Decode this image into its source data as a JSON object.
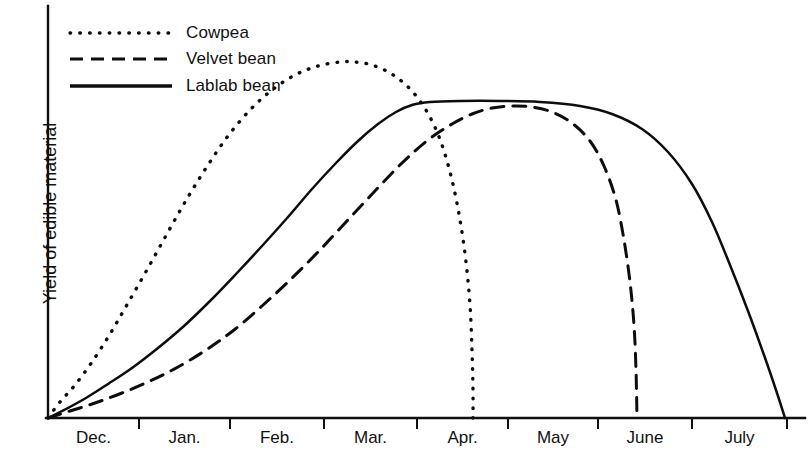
{
  "chart_data": {
    "type": "line",
    "title": "",
    "subtitle": "",
    "xlabel": "",
    "ylabel": "Yield of edible material",
    "grid": false,
    "legend_position": "top-left",
    "x_tick_labels": [
      "Dec.",
      "Jan.",
      "Feb.",
      "Mar.",
      "Apr.",
      "May",
      "June",
      "July"
    ],
    "x_tick_positions_px": [
      139,
      230,
      324,
      417,
      508,
      598,
      692,
      787
    ],
    "x_axis_range_px": [
      48,
      805
    ],
    "y_axis_range_px": [
      418,
      6
    ],
    "y_axis_ticks": [],
    "y_axis_note": "Unlabeled relative scale; baseline at zero yield",
    "series": [
      {
        "name": "Cowpea",
        "style": "dotted",
        "color": "#0d0d0d",
        "points_px": [
          [
            48,
            418
          ],
          [
            60,
            402
          ],
          [
            75,
            385
          ],
          [
            92,
            362
          ],
          [
            110,
            334
          ],
          [
            128,
            303
          ],
          [
            148,
            268
          ],
          [
            168,
            232
          ],
          [
            188,
            197
          ],
          [
            208,
            165
          ],
          [
            228,
            136
          ],
          [
            250,
            110
          ],
          [
            272,
            90
          ],
          [
            295,
            75
          ],
          [
            318,
            66
          ],
          [
            340,
            62
          ],
          [
            355,
            62
          ],
          [
            372,
            65
          ],
          [
            390,
            73
          ],
          [
            406,
            85
          ],
          [
            420,
            101
          ],
          [
            432,
            121
          ],
          [
            442,
            145
          ],
          [
            452,
            180
          ],
          [
            460,
            220
          ],
          [
            466,
            262
          ],
          [
            470,
            305
          ],
          [
            472,
            350
          ],
          [
            473,
            390
          ],
          [
            473,
            418
          ]
        ],
        "peak_month": "Mar.",
        "peak_px": [
          350,
          62
        ],
        "end_month": "Apr.",
        "end_px": [
          473,
          418
        ]
      },
      {
        "name": "Velvet bean",
        "style": "dashed",
        "color": "#0d0d0d",
        "points_px": [
          [
            48,
            418
          ],
          [
            70,
            411
          ],
          [
            95,
            403
          ],
          [
            122,
            393
          ],
          [
            150,
            381
          ],
          [
            178,
            367
          ],
          [
            206,
            350
          ],
          [
            234,
            330
          ],
          [
            262,
            306
          ],
          [
            290,
            280
          ],
          [
            318,
            252
          ],
          [
            346,
            222
          ],
          [
            374,
            192
          ],
          [
            402,
            163
          ],
          [
            428,
            140
          ],
          [
            452,
            124
          ],
          [
            472,
            114
          ],
          [
            492,
            108
          ],
          [
            512,
            106
          ],
          [
            532,
            107
          ],
          [
            552,
            112
          ],
          [
            572,
            123
          ],
          [
            590,
            141
          ],
          [
            604,
            166
          ],
          [
            616,
            200
          ],
          [
            624,
            240
          ],
          [
            630,
            282
          ],
          [
            634,
            325
          ],
          [
            636,
            370
          ],
          [
            637,
            418
          ]
        ],
        "peak_month": "May",
        "peak_px": [
          512,
          106
        ],
        "end_month": "June",
        "end_px": [
          637,
          418
        ]
      },
      {
        "name": "Lablab bean",
        "style": "solid",
        "color": "#0d0d0d",
        "points_px": [
          [
            48,
            418
          ],
          [
            66,
            409
          ],
          [
            86,
            398
          ],
          [
            108,
            384
          ],
          [
            132,
            368
          ],
          [
            158,
            348
          ],
          [
            184,
            326
          ],
          [
            210,
            301
          ],
          [
            236,
            274
          ],
          [
            262,
            246
          ],
          [
            288,
            217
          ],
          [
            312,
            189
          ],
          [
            336,
            163
          ],
          [
            358,
            141
          ],
          [
            378,
            124
          ],
          [
            396,
            112
          ],
          [
            412,
            105
          ],
          [
            430,
            102
          ],
          [
            460,
            101
          ],
          [
            500,
            101
          ],
          [
            540,
            102
          ],
          [
            580,
            106
          ],
          [
            612,
            114
          ],
          [
            642,
            129
          ],
          [
            668,
            152
          ],
          [
            692,
            184
          ],
          [
            712,
            222
          ],
          [
            730,
            265
          ],
          [
            748,
            311
          ],
          [
            764,
            355
          ],
          [
            776,
            390
          ],
          [
            785,
            418
          ]
        ],
        "plateau_start_month": "Mar.",
        "plateau_end_month": "June",
        "plateau_px_y": 101,
        "end_month": "July",
        "end_px": [
          785,
          418
        ]
      }
    ]
  },
  "legend": {
    "items": [
      {
        "label": "Cowpea",
        "style": "dotted"
      },
      {
        "label": "Velvet bean",
        "style": "dashed"
      },
      {
        "label": "Lablab bean",
        "style": "solid"
      }
    ]
  },
  "axes": {
    "y_label": "Yield of edible material",
    "x_labels": [
      "Dec.",
      "Jan.",
      "Feb.",
      "Mar.",
      "Apr.",
      "May",
      "June",
      "July"
    ]
  }
}
